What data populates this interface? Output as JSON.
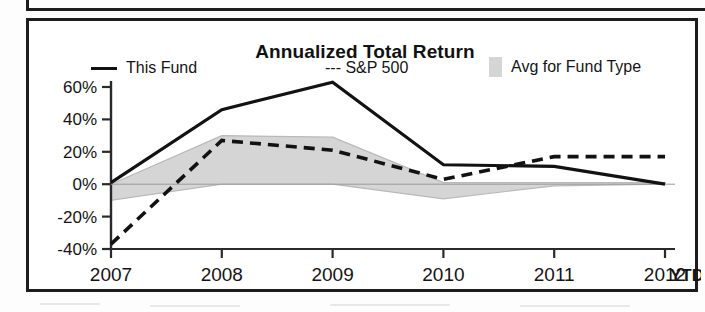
{
  "chart_data": {
    "type": "line",
    "title": "Annualized Total Return",
    "xlabel": "",
    "ylabel": "",
    "x": [
      "2007",
      "2008",
      "2009",
      "2010",
      "2011",
      "2012"
    ],
    "x_extra_label": "YTD",
    "categories": [
      "2007",
      "2008",
      "2009",
      "2010",
      "2011",
      "2012"
    ],
    "ylim": [
      -40,
      60
    ],
    "ytick_labels": [
      "60%",
      "40%",
      "20%",
      "0%",
      "-20%",
      "-40%"
    ],
    "ytick_values": [
      60,
      40,
      20,
      0,
      -20,
      -40
    ],
    "grid": false,
    "legend_position": "top",
    "series": [
      {
        "name": "This Fund",
        "style": "solid",
        "color": "#121212",
        "values": [
          1,
          46,
          63,
          12,
          11,
          0
        ]
      },
      {
        "name": "S&P 500",
        "style": "dashed",
        "color": "#121212",
        "values": [
          -37,
          27,
          21,
          3,
          17,
          17
        ]
      },
      {
        "name": "Avg for Fund Type",
        "style": "band",
        "color": "#d5d5d5",
        "band_upper": [
          0,
          30,
          29,
          1,
          1,
          1
        ],
        "band_lower": [
          -10,
          0,
          0,
          -9,
          -1,
          0
        ]
      }
    ]
  },
  "legend": {
    "items": [
      {
        "label": "This Fund",
        "marker": "solid-line-swatch"
      },
      {
        "label": "--- S&P 500",
        "marker": "dashed-line-swatch"
      },
      {
        "label": "Avg for Fund Type",
        "marker": "band-swatch"
      }
    ]
  },
  "axes": {
    "y_ticks": [
      "60%",
      "40%",
      "20%",
      "0%",
      "-20%",
      "-40%"
    ],
    "x_ticks": [
      "2007",
      "2008",
      "2009",
      "2010",
      "2011",
      "2012"
    ],
    "ytd": "YTD"
  },
  "colors": {
    "line": "#121212",
    "band": "#d5d5d5",
    "frame": "#1d1d1d",
    "text": "#141414"
  }
}
